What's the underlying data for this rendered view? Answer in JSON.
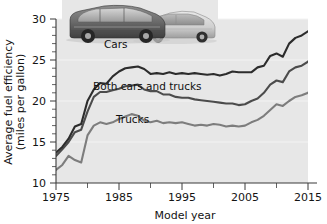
{
  "chart_data": {
    "type": "line",
    "title": "",
    "xlabel": "Model year",
    "ylabel": "Average fuel efficiency (miles per gallon)",
    "ylabel_line1": "Average fuel efficiency",
    "ylabel_line2": "(miles per gallon)",
    "xlim": [
      1975,
      2016
    ],
    "ylim": [
      10,
      30
    ],
    "xticks": [
      1975,
      1985,
      1995,
      2005,
      2015
    ],
    "xticks_minor": [
      1980,
      1990,
      2000,
      2010
    ],
    "yticks": [
      10,
      15,
      20,
      25,
      30
    ],
    "grid": "horizontal-faint",
    "legend": "inline-labels",
    "annotations": [
      {
        "name": "cars-label",
        "text": "Cars",
        "x": 1982.5,
        "y": 24.6
      },
      {
        "name": "both-label",
        "text": "Both cars and trucks",
        "x": 1983.0,
        "y": 19.9
      },
      {
        "name": "trucks-label",
        "text": "Trucks",
        "x": 1986.5,
        "y": 16.4
      }
    ],
    "photo_caption": "Photo of an SUV and a sedan",
    "x": [
      1975,
      1976,
      1977,
      1978,
      1979,
      1980,
      1981,
      1982,
      1983,
      1984,
      1985,
      1986,
      1987,
      1988,
      1989,
      1990,
      1991,
      1992,
      1993,
      1994,
      1995,
      1996,
      1997,
      1998,
      1999,
      2000,
      2001,
      2002,
      2003,
      2004,
      2005,
      2006,
      2007,
      2008,
      2009,
      2010,
      2011,
      2012,
      2013,
      2014,
      2015,
      2016
    ],
    "series": [
      {
        "name": "Cars",
        "color": "#2c2c2c",
        "values": [
          13.7,
          14.4,
          15.4,
          16.9,
          17.2,
          20.0,
          21.4,
          22.2,
          22.1,
          23.0,
          23.6,
          24.0,
          24.1,
          24.2,
          23.9,
          23.3,
          23.4,
          23.3,
          23.5,
          23.3,
          23.4,
          23.3,
          23.4,
          23.3,
          23.2,
          23.3,
          23.1,
          23.3,
          23.6,
          23.5,
          23.5,
          23.5,
          24.1,
          24.3,
          25.5,
          25.8,
          25.4,
          27.0,
          27.7,
          28.0,
          28.5,
          29.2
        ]
      },
      {
        "name": "Both cars and trucks",
        "color": "#4c4c4c",
        "values": [
          13.3,
          14.1,
          15.0,
          16.2,
          16.5,
          18.7,
          20.5,
          21.1,
          21.1,
          21.3,
          21.5,
          21.8,
          21.9,
          22.0,
          21.4,
          21.2,
          21.2,
          20.8,
          20.8,
          20.5,
          20.4,
          20.4,
          20.2,
          20.1,
          20.0,
          19.9,
          19.8,
          19.7,
          19.7,
          19.5,
          19.6,
          20.0,
          20.3,
          21.0,
          22.0,
          22.5,
          22.3,
          23.6,
          24.1,
          24.3,
          24.8,
          25.8
        ]
      },
      {
        "name": "Trucks",
        "color": "#7d7d7d",
        "values": [
          11.6,
          12.2,
          13.3,
          12.8,
          12.5,
          15.8,
          17.0,
          17.4,
          17.2,
          17.4,
          17.8,
          18.1,
          18.4,
          18.2,
          17.6,
          17.4,
          17.6,
          17.3,
          17.4,
          17.3,
          17.4,
          17.2,
          17.0,
          17.1,
          17.0,
          17.2,
          17.1,
          16.9,
          17.0,
          16.9,
          17.0,
          17.4,
          17.7,
          18.2,
          18.9,
          19.6,
          19.4,
          20.0,
          20.5,
          20.7,
          21.0,
          21.7
        ]
      }
    ]
  }
}
